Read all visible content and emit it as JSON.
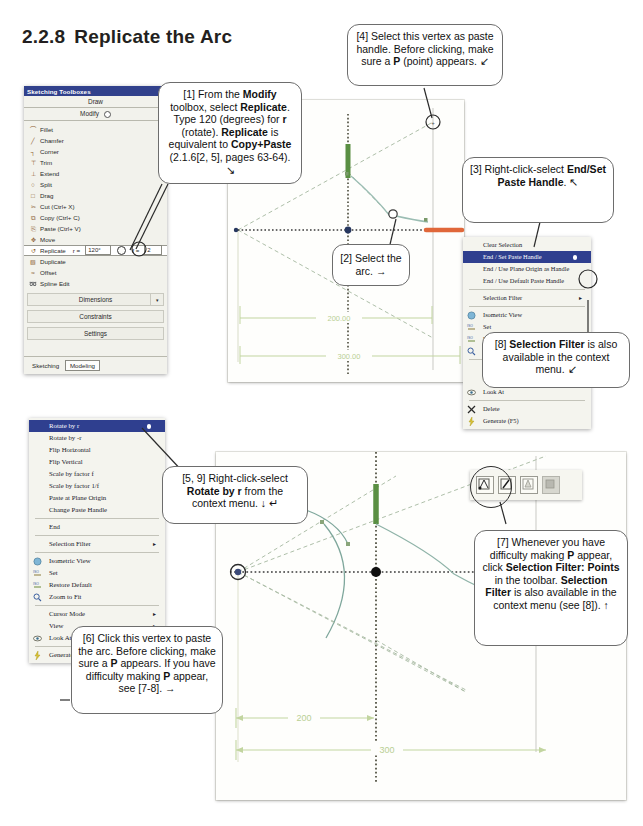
{
  "page": {
    "section_number": "2.2.8",
    "section_title": "Replicate the Arc"
  },
  "toolbox": {
    "window_title": "Sketching Toolboxes",
    "bar_draw": "Draw",
    "bar_modify": "Modify",
    "items": [
      {
        "label": "Fillet",
        "glyph": "⌒"
      },
      {
        "label": "Chamfer",
        "glyph": "╱"
      },
      {
        "label": "Corner",
        "glyph": "┐"
      },
      {
        "label": "Trim",
        "glyph": "⊤"
      },
      {
        "label": "Extend",
        "glyph": "⊥"
      },
      {
        "label": "Split",
        "glyph": "○"
      },
      {
        "label": "Drag",
        "glyph": "□"
      },
      {
        "label": "Cut (Ctrl+ X)",
        "glyph": "✂"
      },
      {
        "label": "Copy (Ctrl+ C)",
        "glyph": "⧉"
      },
      {
        "label": "Paste (Ctrl+ V)",
        "glyph": "⎘"
      },
      {
        "label": "Move",
        "glyph": "✥"
      }
    ],
    "replicate": {
      "label": "Replicate",
      "r_label": "r =",
      "r_value": "120°",
      "f_label": "f =",
      "f_value": "2"
    },
    "items_after": [
      {
        "label": "Duplicate",
        "glyph": "▧"
      },
      {
        "label": "Offset",
        "glyph": "≈"
      },
      {
        "label": "Spline Edit",
        "glyph": "➿"
      }
    ],
    "groups": [
      "Dimensions",
      "Constraints",
      "Settings"
    ],
    "tabs": [
      {
        "label": "Sketching",
        "active": false
      },
      {
        "label": "Modeling",
        "active": true
      }
    ]
  },
  "callouts": {
    "c1": {
      "segments": [
        {
          "t": "[1] From the ",
          "b": false
        },
        {
          "t": "Modify",
          "b": true
        },
        {
          "t": " toolbox, select ",
          "b": false
        },
        {
          "t": "Replicate",
          "b": true
        },
        {
          "t": ". Type 120 (degrees) for ",
          "b": false
        },
        {
          "t": "r",
          "b": true
        },
        {
          "t": " (rotate). ",
          "b": false
        },
        {
          "t": "Replicate",
          "b": true
        },
        {
          "t": " is equivalent to ",
          "b": false
        },
        {
          "t": "Copy+Paste",
          "b": true
        },
        {
          "t": " (2.1.6[2, 5], pages 63-64). ↘",
          "b": false
        }
      ]
    },
    "c2": {
      "segments": [
        {
          "t": "[2] Select the arc. →",
          "b": false
        }
      ]
    },
    "c3": {
      "segments": [
        {
          "t": "[3] Right-click-select ",
          "b": false
        },
        {
          "t": "End/Set Paste Handle",
          "b": true
        },
        {
          "t": ". ↖",
          "b": false
        }
      ]
    },
    "c4": {
      "segments": [
        {
          "t": "[4] Select this vertex as paste handle. Before clicking, make sure a ",
          "b": false
        },
        {
          "t": "P",
          "b": true
        },
        {
          "t": " (point) appears. ↙",
          "b": false
        }
      ]
    },
    "c5": {
      "segments": [
        {
          "t": "[5, 9]  Right-click-select ",
          "b": false
        },
        {
          "t": "Rotate by r",
          "b": true
        },
        {
          "t": " from the context menu. ↓  ↵",
          "b": false
        }
      ]
    },
    "c6": {
      "segments": [
        {
          "t": "[6] Click this vertex to paste the arc.  Before clicking, make sure a ",
          "b": false
        },
        {
          "t": "P",
          "b": true
        },
        {
          "t": " appears.  If you have difficulty making ",
          "b": false
        },
        {
          "t": "P",
          "b": true
        },
        {
          "t": " appear, see [7-8]. →",
          "b": false
        }
      ]
    },
    "c7": {
      "segments": [
        {
          "t": "[7] Whenever you have difficulty making ",
          "b": false
        },
        {
          "t": "P",
          "b": true
        },
        {
          "t": " appear, click ",
          "b": false
        },
        {
          "t": "Selection Filter: Points",
          "b": true
        },
        {
          "t": " in the toolbar. ",
          "b": false
        },
        {
          "t": "Selection Filter",
          "b": true
        },
        {
          "t": " is also available in the context menu (see [8]). ↑",
          "b": false
        }
      ]
    },
    "c8": {
      "segments": [
        {
          "t": "[8] ",
          "b": false
        },
        {
          "t": "Selection Filter",
          "b": true
        },
        {
          "t": " is also available in the context menu. ↙",
          "b": false
        }
      ]
    }
  },
  "context_menu_right": {
    "items": [
      {
        "label": "Clear Selection",
        "highlight": false,
        "bullet": false,
        "submenu": false,
        "icon": null
      },
      {
        "label": "End / Set Paste Handle",
        "highlight": true,
        "bullet": true,
        "submenu": false,
        "icon": null
      },
      {
        "label": "End / Use Plane Origin as Handle",
        "highlight": false,
        "bullet": false,
        "submenu": false,
        "icon": null
      },
      {
        "label": "End / Use Default Paste Handle",
        "highlight": false,
        "bullet": false,
        "submenu": false,
        "icon": null
      },
      {
        "sep": true
      },
      {
        "label": "Selection Filter",
        "highlight": false,
        "bullet": false,
        "submenu": true,
        "icon": null
      },
      {
        "sep": true
      },
      {
        "label": "Isometric View",
        "highlight": false,
        "bullet": false,
        "submenu": false,
        "icon": "sphere"
      },
      {
        "label": "Set",
        "highlight": false,
        "bullet": false,
        "submenu": false,
        "icon": "iso"
      },
      {
        "label": "Restore Default",
        "highlight": false,
        "bullet": false,
        "submenu": false,
        "icon": "iso"
      },
      {
        "label": "Zoom to Fit",
        "highlight": false,
        "bullet": false,
        "submenu": false,
        "icon": "zoom"
      },
      {
        "sep": true
      },
      {
        "label": "Cursor Mode",
        "highlight": false,
        "bullet": false,
        "submenu": true,
        "icon": null
      },
      {
        "label": "View",
        "highlight": false,
        "bullet": false,
        "submenu": true,
        "icon": null
      },
      {
        "label": "Look At",
        "highlight": false,
        "bullet": false,
        "submenu": false,
        "icon": "lookat"
      },
      {
        "sep": true
      },
      {
        "label": "Delete",
        "highlight": false,
        "bullet": false,
        "submenu": false,
        "icon": "x"
      },
      {
        "label": "Generate (F5)",
        "highlight": false,
        "bullet": false,
        "submenu": false,
        "icon": "bolt"
      }
    ]
  },
  "context_menu_left": {
    "items": [
      {
        "label": "Rotate by r",
        "highlight": true,
        "bullet": true,
        "submenu": false,
        "icon": null
      },
      {
        "label": "Rotate by -r",
        "highlight": false,
        "bullet": false,
        "submenu": false,
        "icon": null
      },
      {
        "label": "Flip Horizontal",
        "highlight": false,
        "bullet": false,
        "submenu": false,
        "icon": null
      },
      {
        "label": "Flip Vertical",
        "highlight": false,
        "bullet": false,
        "submenu": false,
        "icon": null
      },
      {
        "label": "Scale by factor f",
        "highlight": false,
        "bullet": false,
        "submenu": false,
        "icon": null
      },
      {
        "label": "Scale by factor 1/f",
        "highlight": false,
        "bullet": false,
        "submenu": false,
        "icon": null
      },
      {
        "label": "Paste at Plane Origin",
        "highlight": false,
        "bullet": false,
        "submenu": false,
        "icon": null
      },
      {
        "label": "Change Paste Handle",
        "highlight": false,
        "bullet": false,
        "submenu": false,
        "icon": null
      },
      {
        "sep": true
      },
      {
        "label": "End",
        "highlight": false,
        "bullet": false,
        "submenu": false,
        "icon": null
      },
      {
        "sep": true
      },
      {
        "label": "Selection Filter",
        "highlight": false,
        "bullet": false,
        "submenu": true,
        "icon": null
      },
      {
        "sep": true
      },
      {
        "label": "Isometric View",
        "highlight": false,
        "bullet": false,
        "submenu": false,
        "icon": "sphere"
      },
      {
        "label": "Set",
        "highlight": false,
        "bullet": false,
        "submenu": false,
        "icon": "iso"
      },
      {
        "label": "Restore Default",
        "highlight": false,
        "bullet": false,
        "submenu": false,
        "icon": "iso"
      },
      {
        "label": "Zoom to Fit",
        "highlight": false,
        "bullet": false,
        "submenu": false,
        "icon": "zoom"
      },
      {
        "sep": true
      },
      {
        "label": "Cursor Mode",
        "highlight": false,
        "bullet": false,
        "submenu": true,
        "icon": null
      },
      {
        "label": "View",
        "highlight": false,
        "bullet": false,
        "submenu": true,
        "icon": null
      },
      {
        "label": "Look At",
        "highlight": false,
        "bullet": false,
        "submenu": false,
        "icon": "lookat"
      },
      {
        "sep": true
      },
      {
        "label": "Generate (F5)",
        "highlight": false,
        "bullet": false,
        "submenu": false,
        "icon": "bolt"
      }
    ]
  },
  "selection_toolbar": {
    "buttons": [
      {
        "name": "selection-filter-points",
        "enabled": true,
        "selected": true
      },
      {
        "name": "selection-filter-edges",
        "enabled": true,
        "selected": false
      },
      {
        "name": "selection-filter-faces",
        "enabled": true,
        "selected": false
      },
      {
        "name": "selection-filter-bodies",
        "enabled": false,
        "selected": false
      }
    ]
  },
  "viewport_top": {
    "dimensions": [
      {
        "value": "200.00"
      },
      {
        "value": "300.00"
      }
    ],
    "colors": {
      "construction": "#b9c7b4",
      "dimension": "#c8d9a8",
      "axis": "#3a3a3a",
      "selected_edge": "#e0673a",
      "green_edge": "#4e8b3a",
      "origin": "#2a3c6e"
    }
  },
  "viewport_bottom": {
    "dimensions": [
      {
        "value": "200"
      },
      {
        "value": "300"
      }
    ],
    "colors": {
      "construction": "#b9c7b4",
      "dimension": "#c8d9a8",
      "axis": "#3a3a3a",
      "selected_edge": "#e0673a",
      "green_edge": "#4e8b3a",
      "arc": "#6f9f93"
    }
  }
}
